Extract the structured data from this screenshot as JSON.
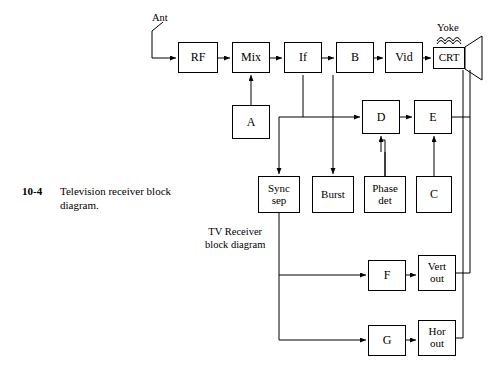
{
  "figure": {
    "number": "10-4",
    "caption": "Television receiver block\ndiagram."
  },
  "labels": {
    "antenna": "Ant",
    "yoke": "Yoke",
    "inner_note": "TV Receiver\nblock diagram"
  },
  "blocks": [
    {
      "id": "rf",
      "label": "RF",
      "x": 178,
      "y": 42,
      "w": 40,
      "h": 31
    },
    {
      "id": "mix",
      "label": "Mix",
      "x": 232,
      "y": 42,
      "w": 38,
      "h": 31
    },
    {
      "id": "if",
      "label": "If",
      "x": 284,
      "y": 42,
      "w": 38,
      "h": 31
    },
    {
      "id": "b",
      "label": "B",
      "x": 336,
      "y": 42,
      "w": 38,
      "h": 31
    },
    {
      "id": "vid",
      "label": "Vid",
      "x": 385,
      "y": 42,
      "w": 38,
      "h": 31
    },
    {
      "id": "crt",
      "label": "CRT",
      "x": 433,
      "y": 47,
      "w": 32,
      "h": 22
    },
    {
      "id": "a",
      "label": "A",
      "x": 232,
      "y": 105,
      "w": 38,
      "h": 34
    },
    {
      "id": "d",
      "label": "D",
      "x": 362,
      "y": 100,
      "w": 38,
      "h": 34
    },
    {
      "id": "e",
      "label": "E",
      "x": 414,
      "y": 100,
      "w": 38,
      "h": 34
    },
    {
      "id": "syncsep",
      "label": "Sync\nsep",
      "x": 258,
      "y": 176,
      "w": 42,
      "h": 37
    },
    {
      "id": "burst",
      "label": "Burst",
      "x": 312,
      "y": 176,
      "w": 42,
      "h": 37
    },
    {
      "id": "phasedet",
      "label": "Phase\ndet",
      "x": 364,
      "y": 176,
      "w": 42,
      "h": 37
    },
    {
      "id": "c",
      "label": "C",
      "x": 416,
      "y": 176,
      "w": 36,
      "h": 37
    },
    {
      "id": "f",
      "label": "F",
      "x": 368,
      "y": 260,
      "w": 38,
      "h": 31
    },
    {
      "id": "vertout",
      "label": "Vert\nout",
      "x": 418,
      "y": 255,
      "w": 38,
      "h": 36
    },
    {
      "id": "g",
      "label": "G",
      "x": 368,
      "y": 325,
      "w": 38,
      "h": 31
    },
    {
      "id": "horout",
      "label": "Hor\nout",
      "x": 418,
      "y": 320,
      "w": 38,
      "h": 36
    }
  ]
}
